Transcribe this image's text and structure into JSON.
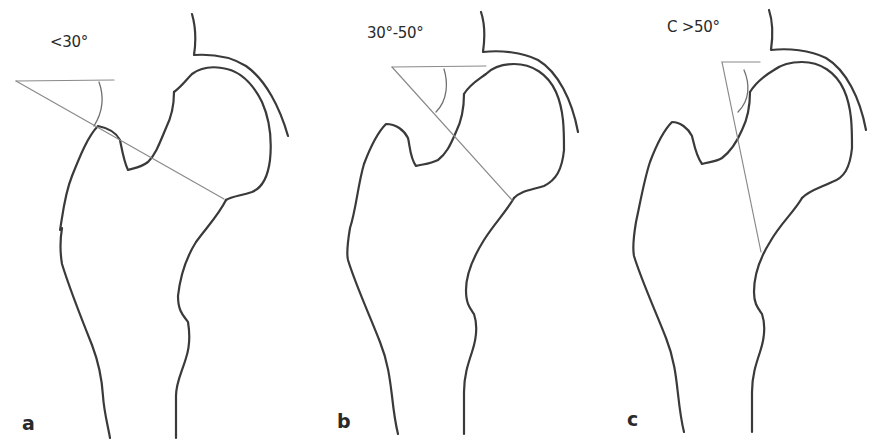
{
  "figure": {
    "colors": {
      "bone_outline": "#3a3a3a",
      "measurement_line": "#8a8a8a",
      "angle_arc": "#707070",
      "text": "#2a2a2a",
      "background": "#ffffff"
    },
    "panels": [
      {
        "letter": "a",
        "angle_label": "<30°"
      },
      {
        "letter": "b",
        "angle_label": "30°-50°"
      },
      {
        "letter": "c",
        "angle_label": "C >50°"
      }
    ]
  }
}
